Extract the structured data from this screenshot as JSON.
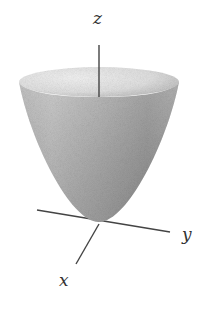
{
  "figure": {
    "surface": {
      "shape": "paraboloid",
      "fill_color": "#a8a8a8",
      "rim_inner_color": "#e4e4e4",
      "shade_dark": "#8a8a8a"
    },
    "axes": {
      "color": "#444444",
      "labels": {
        "z": "z",
        "y": "y",
        "x": "x"
      }
    }
  }
}
